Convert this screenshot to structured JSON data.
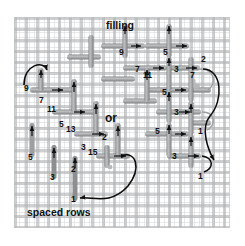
{
  "diagram": {
    "canvas": {
      "width": 245,
      "height": 246,
      "background": "#ffffff"
    },
    "fabric": {
      "name": "even-weave canvas",
      "grid_color": "#b0b2b4",
      "cell_px": 11,
      "left": 14,
      "top": 17,
      "width": 216,
      "height": 211
    },
    "colors": {
      "thread": "#9d9fa1",
      "thread_edge": "#6e7072",
      "arrow": "#111111",
      "curve_black": "#0b0b0b",
      "curve_gray": "#9d9fa1",
      "text": "#111111"
    },
    "captions": [
      {
        "id": "filling",
        "text": "filling",
        "x": 106,
        "y": 20,
        "size": "cap"
      },
      {
        "id": "or",
        "text": "or",
        "x": 105,
        "y": 112,
        "size": "orlbl"
      },
      {
        "id": "spaced-rows",
        "text": "spaced rows",
        "x": 27,
        "y": 207,
        "size": "cap"
      }
    ],
    "stitch_numbers": {
      "filling_block": [
        {
          "text": "9",
          "x": 119,
          "y": 48
        },
        {
          "text": "5",
          "x": 163,
          "y": 48
        },
        {
          "text": "2",
          "x": 201,
          "y": 55
        },
        {
          "text": "7",
          "x": 135,
          "y": 65
        },
        {
          "text": "11",
          "x": 143,
          "y": 71
        },
        {
          "text": "3",
          "x": 174,
          "y": 65
        },
        {
          "text": "7",
          "x": 190,
          "y": 71
        },
        {
          "text": "5",
          "x": 162,
          "y": 88
        },
        {
          "text": "3",
          "x": 174,
          "y": 108
        },
        {
          "text": "5",
          "x": 155,
          "y": 127
        },
        {
          "text": "1",
          "x": 198,
          "y": 127
        },
        {
          "text": "3",
          "x": 172,
          "y": 152
        },
        {
          "text": "1",
          "x": 198,
          "y": 172
        }
      ],
      "spaced_rows_block": [
        {
          "text": "9",
          "x": 24,
          "y": 84
        },
        {
          "text": "7",
          "x": 39,
          "y": 96
        },
        {
          "text": "11",
          "x": 47,
          "y": 105
        },
        {
          "text": "5",
          "x": 59,
          "y": 120
        },
        {
          "text": "13",
          "x": 66,
          "y": 125
        },
        {
          "text": "2",
          "x": 102,
          "y": 133
        },
        {
          "text": "3",
          "x": 81,
          "y": 143
        },
        {
          "text": "15",
          "x": 88,
          "y": 148
        },
        {
          "text": "5",
          "x": 28,
          "y": 153
        },
        {
          "text": "3",
          "x": 50,
          "y": 173
        },
        {
          "text": "2",
          "x": 71,
          "y": 165
        },
        {
          "text": "1",
          "x": 71,
          "y": 195
        }
      ]
    },
    "legend": {
      "thread_label": "worked stitch",
      "arrow_label": "needle direction",
      "curve_label": "thread path on reverse"
    }
  }
}
